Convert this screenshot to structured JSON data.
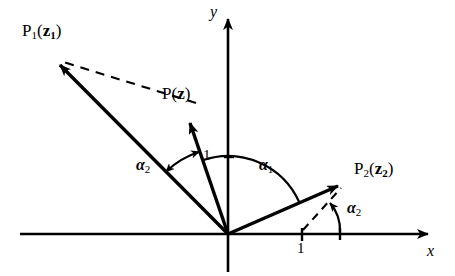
{
  "figure": {
    "kind": "vector-diagram",
    "background_color": "#ffffff",
    "stroke_color": "#000000",
    "axes": {
      "x_label": "x",
      "y_label": "y",
      "origin_px": [
        228,
        234
      ],
      "x_axis_start_px": [
        20,
        234
      ],
      "x_axis_tip_px": [
        436,
        234
      ],
      "y_axis_tip_px": [
        228,
        8
      ],
      "x_label_pos_px": [
        427,
        244
      ],
      "y_label_pos_px": [
        210,
        6
      ]
    },
    "ticks": [
      {
        "name": "y-unit-tick",
        "label": "1",
        "axis": "y",
        "value": 1,
        "tick_px": [
          228,
          157
        ],
        "label_pos_px": [
          202,
          149
        ]
      },
      {
        "name": "x-unit-tick",
        "label": "1",
        "axis": "x",
        "value": 1,
        "tick_px": [
          302,
          234
        ],
        "label_pos_px": [
          296,
          241
        ]
      }
    ],
    "vectors": [
      {
        "name": "vector-p1",
        "label": "P_1(z_1)",
        "label_main": "P",
        "label_sub": "1",
        "label_arg": "z",
        "label_arg_sub": "1",
        "from_px": [
          228,
          234
        ],
        "to_px": [
          52,
          57
        ],
        "angle_deg": 135,
        "label_pos_px": [
          22,
          24
        ]
      },
      {
        "name": "vector-p",
        "label": "P(z)",
        "label_main": "P",
        "label_sub": "",
        "label_arg": "z",
        "label_arg_sub": "",
        "from_px": [
          228,
          234
        ],
        "to_px": [
          186,
          114
        ],
        "angle_deg": 109,
        "label_pos_px": [
          163,
          86
        ]
      },
      {
        "name": "vector-p2",
        "label": "P_2(z_2)",
        "label_main": "P",
        "label_sub": "2",
        "label_arg": "z",
        "label_arg_sub": "2",
        "from_px": [
          228,
          234
        ],
        "to_px": [
          347,
          182
        ],
        "angle_deg": 24,
        "label_pos_px": [
          354,
          160
        ]
      }
    ],
    "dashed_lines": [
      {
        "name": "dashed-p-to-p1",
        "from_px": [
          194,
          101
        ],
        "to_px": [
          58,
          60
        ]
      },
      {
        "name": "dashed-unit-to-p2",
        "from_px": [
          303,
          231
        ],
        "to_px": [
          340,
          189
        ]
      }
    ],
    "angles": [
      {
        "name": "angle-alpha1",
        "label_main": "α",
        "label_sub": "1",
        "description": "arc from vector-p2 to vector-p measured at origin",
        "label_pos_px": [
          259,
          157
        ],
        "radius_px": 78,
        "start_deg": 24,
        "end_deg": 109
      },
      {
        "name": "angle-alpha2-left",
        "label_main": "α",
        "label_sub": "2",
        "description": "double-headed arc between vector-p1 and vector-p",
        "label_pos_px": [
          136,
          157
        ],
        "radius_px": 88,
        "start_deg": 109,
        "end_deg": 135
      },
      {
        "name": "angle-alpha2-right",
        "label_main": "α",
        "label_sub": "2",
        "description": "curved arrow from x-axis to vector-p2 near unit point",
        "label_pos_px": [
          346,
          200
        ],
        "radius_px": 40,
        "start_deg": 0,
        "end_deg": 64
      }
    ]
  }
}
